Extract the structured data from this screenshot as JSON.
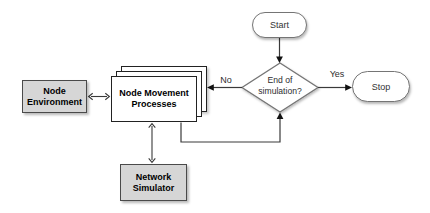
{
  "diagram": {
    "nodes": {
      "start": {
        "label": "Start"
      },
      "decision": {
        "line1": "End of",
        "line2": "simulation?"
      },
      "stop": {
        "label": "Stop"
      },
      "node_environment": {
        "line1": "Node",
        "line2": "Environment"
      },
      "node_movement_processes": {
        "line1": "Node Movement",
        "line2": "Processes"
      },
      "network_simulator": {
        "line1": "Network",
        "line2": "Simulator"
      }
    },
    "edge_labels": {
      "no": "No",
      "yes": "Yes"
    },
    "colors": {
      "background": "#ffffff",
      "process_box_fill": "#d6d6d6",
      "process_box_border": "#4a4a4a",
      "sheet_fill": "#ffffff",
      "sheet_border": "#222222",
      "terminal_fill": "#ffffff",
      "terminal_border": "#757575",
      "connector": "#3a3a3a",
      "arrowhead": "#111111",
      "label_text": "#000000",
      "terminal_text": "#333333"
    }
  }
}
